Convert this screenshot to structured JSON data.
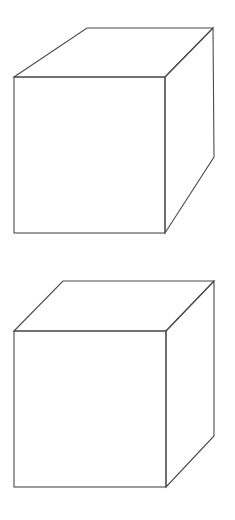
{
  "figure": {
    "line_color": "#4a4a4a",
    "background": "#ffffff",
    "cubes": [
      {
        "id": "cube-top",
        "front_face": {
          "x1": 14,
          "y1": 77,
          "x2": 165,
          "y2": 233
        },
        "top_back_left": [
          87,
          28
        ],
        "top_back_right": [
          213,
          28
        ],
        "back_bottom_right": [
          214,
          157
        ]
      },
      {
        "id": "cube-bottom",
        "front_face": {
          "x1": 14,
          "y1": 331,
          "x2": 166,
          "y2": 487
        },
        "top_back_left": [
          63,
          281
        ],
        "top_back_right": [
          214,
          281
        ],
        "back_bottom_right": [
          214,
          436
        ]
      }
    ]
  }
}
